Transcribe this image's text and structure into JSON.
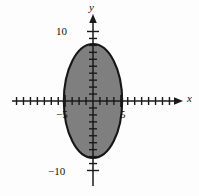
{
  "figure": {
    "title": "",
    "kind": "cartesian-coordinate-plane-with-shaded-ellipse"
  },
  "axes": {
    "x_axis_name": "x",
    "y_axis_name": "y",
    "origin_px": {
      "x": 93,
      "y": 101
    },
    "unit_px": 6.95,
    "x_range_px": {
      "start": 12,
      "end": 183
    },
    "y_range_px": {
      "start": 14,
      "end": 186
    }
  },
  "tick_labels": {
    "y_top": "10",
    "y_bottom": "−10",
    "x_left": "−5",
    "x_right": "5"
  },
  "colors": {
    "axis": "#1a1a1a",
    "ellipse_fill": "#807f80",
    "ellipse_stroke": "#161616",
    "background": "#fdfdfd",
    "text": "#111111"
  },
  "chart_data": {
    "type": "scatter",
    "title": "",
    "xlabel": "x",
    "ylabel": "y",
    "xlim": [
      -11.7,
      12.9
    ],
    "ylim": [
      -12.5,
      12.5
    ],
    "grid": false,
    "legend": null,
    "x_ticks": [
      -11,
      -10,
      -9,
      -8,
      -7,
      -6,
      -5,
      -4,
      -3,
      -2,
      -1,
      1,
      2,
      3,
      4,
      5,
      6,
      7,
      8,
      9,
      10,
      11,
      12
    ],
    "y_ticks": [
      -10,
      -9,
      -8,
      -7,
      -6,
      -5,
      -4,
      -3,
      -2,
      -1,
      1,
      2,
      3,
      4,
      5,
      6,
      7,
      8,
      9,
      10
    ],
    "labeled_x_ticks": [
      -5,
      5
    ],
    "labeled_y_ticks": [
      -10,
      10
    ],
    "shapes": [
      {
        "kind": "ellipse",
        "center": [
          0,
          0
        ],
        "semi_axis_x": 4.2,
        "semi_axis_y": 8.2,
        "x_intercepts": [
          -4.2,
          4.2
        ],
        "y_intercepts": [
          -8.2,
          8.2
        ],
        "fill": "#807f80",
        "stroke": "#161616",
        "filled": true,
        "equation": "x^2/4.2^2 + y^2/8.2^2 = 1"
      }
    ]
  }
}
